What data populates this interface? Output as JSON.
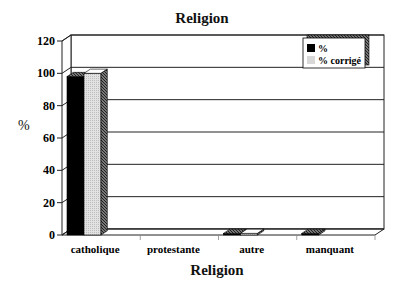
{
  "chart_data": {
    "type": "bar",
    "title": "Religion",
    "xlabel": "Religion",
    "ylabel": "%",
    "categories": [
      "catholique",
      "protestante",
      "autre",
      "manquant"
    ],
    "series": [
      {
        "name": "%",
        "color": "#000000",
        "values": [
          98,
          0,
          1,
          1
        ]
      },
      {
        "name": "% corrigé",
        "color": "#d8d8d8",
        "values": [
          100,
          0,
          1,
          0
        ]
      }
    ],
    "ylim": [
      0,
      120
    ],
    "yticks": [
      0,
      20,
      40,
      60,
      80,
      100,
      120
    ],
    "grid": true,
    "legend_position": "top-right",
    "style": "3d"
  },
  "labels": {
    "title": "Religion",
    "xlabel": "Religion",
    "ylabel": "%",
    "legend": [
      "%",
      "% corrigé"
    ],
    "categories": [
      "catholique",
      "protestante",
      "autre",
      "manquant"
    ],
    "yticks": [
      "0",
      "20",
      "40",
      "60",
      "80",
      "100",
      "120"
    ]
  }
}
